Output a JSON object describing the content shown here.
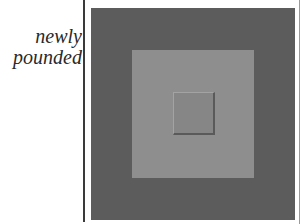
{
  "caption": {
    "line1": "newly",
    "line2": "pounded"
  },
  "artwork": {
    "description": "nested squares",
    "colors": {
      "outer": "#5c5c5c",
      "middle": "#8e8e8e",
      "inner": "#868686"
    }
  }
}
